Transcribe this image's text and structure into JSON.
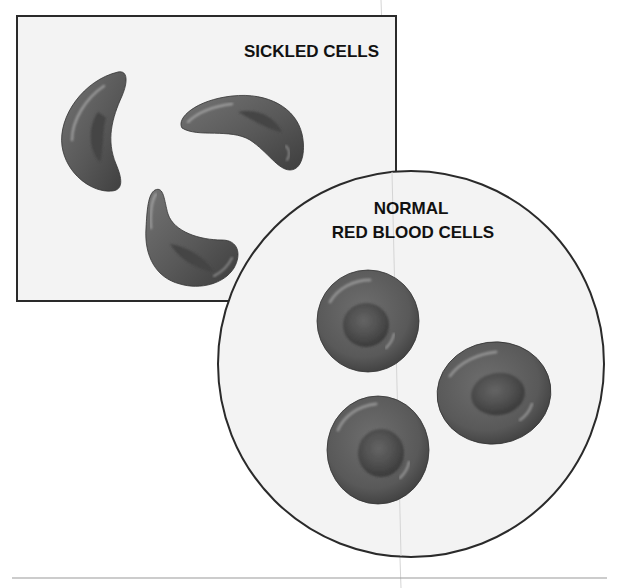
{
  "diagram": {
    "type": "illustration",
    "panels": {
      "sickled": {
        "label": "SICKLED CELLS",
        "cell_count": 3,
        "shape": "rectangle"
      },
      "normal": {
        "label_line1": "NORMAL",
        "label_line2": "RED BLOOD CELLS",
        "cell_count": 3,
        "shape": "circle"
      }
    },
    "colors": {
      "cell_fill": "#5e5e5e",
      "cell_dark": "#3a3a3a",
      "cell_highlight": "#a8a8a8",
      "panel_background": "#f3f3f3",
      "border": "#2a2a2a",
      "text": "#111111",
      "rule": "#9a9a9a"
    }
  }
}
